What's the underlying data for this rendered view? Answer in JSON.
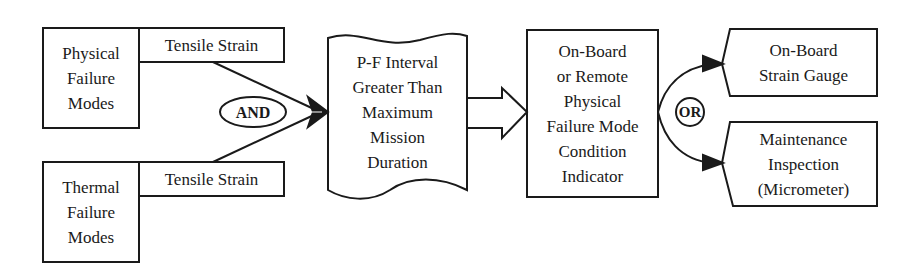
{
  "diagram": {
    "type": "flow",
    "line_color": "#1a1a1a",
    "background": "#ffffff",
    "nodes": {
      "physical_failure_modes": {
        "label": "Physical\nFailure\nModes",
        "shape": "rectangle"
      },
      "tensile_strain_top": {
        "label": "Tensile Strain",
        "shape": "rectangle"
      },
      "thermal_failure_modes": {
        "label": "Thermal\nFailure\nModes",
        "shape": "rectangle"
      },
      "tensile_strain_bottom": {
        "label": "Tensile Strain",
        "shape": "rectangle"
      },
      "and_gate": {
        "label": "AND",
        "shape": "ellipse"
      },
      "pf_interval": {
        "label": "P-F Interval\nGreater Than\nMaximum\nMission\nDuration",
        "shape": "wavy-document"
      },
      "condition_indicator": {
        "label": "On-Board\nor Remote\nPhysical\nFailure Mode\nCondition\nIndicator",
        "shape": "rectangle"
      },
      "or_gate": {
        "label": "OR",
        "shape": "circle"
      },
      "strain_gauge": {
        "label": "On-Board\nStrain Gauge",
        "shape": "notched-rectangle"
      },
      "maintenance_inspection": {
        "label": "Maintenance\nInspection\n(Micrometer)",
        "shape": "notched-rectangle"
      }
    },
    "edges": [
      {
        "from": "tensile_strain_top",
        "to": "pf_interval",
        "via": "and_gate"
      },
      {
        "from": "tensile_strain_bottom",
        "to": "pf_interval",
        "via": "and_gate"
      },
      {
        "from": "pf_interval",
        "to": "condition_indicator",
        "style": "block-arrow"
      },
      {
        "from": "condition_indicator",
        "to": "strain_gauge",
        "via": "or_gate"
      },
      {
        "from": "condition_indicator",
        "to": "maintenance_inspection",
        "via": "or_gate"
      }
    ]
  }
}
